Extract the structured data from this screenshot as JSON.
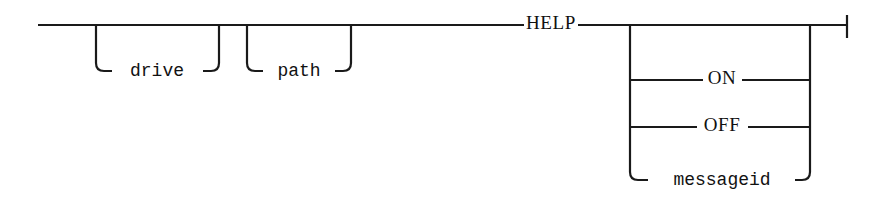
{
  "diagram": {
    "type": "railroad-syntax-diagram",
    "stroke_color": "#1a1a1a",
    "background_color": "#ffffff",
    "canvas": {
      "width": 888,
      "height": 197
    },
    "main_track_y": 25,
    "entry_x": 38,
    "exit_x": 847,
    "terminator": {
      "x": 847,
      "y_top": 15,
      "y_bottom": 38,
      "label": "end-bar"
    },
    "optional_prefix_boxes": [
      {
        "id": "drive",
        "label": "drive",
        "style": "mono",
        "left_x": 96,
        "right_x": 219,
        "branch_y": 71,
        "text_x": 157
      },
      {
        "id": "path",
        "label": "path",
        "style": "mono",
        "left_x": 247,
        "right_x": 351,
        "branch_y": 71,
        "text_x": 299
      }
    ],
    "keyword": {
      "id": "help",
      "label": "HELP",
      "style": "serif",
      "text_x": 551,
      "text_y": 25,
      "gap_left_x": 524,
      "gap_right_x": 578
    },
    "choice_group": {
      "left_rail_x": 630,
      "right_rail_x": 810,
      "top_y": 25,
      "options": [
        {
          "id": "empty",
          "label": "",
          "style": "none",
          "branch_y": 25,
          "text_x": 720,
          "is_default_path": true
        },
        {
          "id": "on",
          "label": "ON",
          "style": "serif",
          "branch_y": 80,
          "text_x": 722,
          "gap_left_x": 703,
          "gap_right_x": 742,
          "corner": "tee"
        },
        {
          "id": "off",
          "label": "OFF",
          "style": "serif",
          "branch_y": 127,
          "text_x": 722,
          "gap_left_x": 697,
          "gap_right_x": 748,
          "corner": "tee"
        },
        {
          "id": "messageid",
          "label": "messageid",
          "style": "mono",
          "branch_y": 180,
          "text_x": 722,
          "gap_left_x": 648,
          "gap_right_x": 795,
          "corner": "round"
        }
      ]
    }
  },
  "tokens": {
    "drive": "drive",
    "path": "path",
    "help": "HELP",
    "on": "ON",
    "off": "OFF",
    "messageid": "messageid"
  }
}
